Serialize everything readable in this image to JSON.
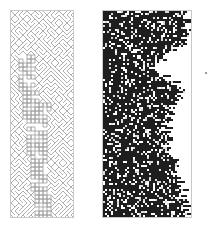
{
  "figure": {
    "panels": [
      {
        "id": "left",
        "description": "light gray lattice of interacting diagonal lines (automaton with particle interactions)",
        "line_color": "#9c9c9c",
        "background": "#ffffff",
        "cell": 4,
        "cols": 16,
        "rows": 52
      },
      {
        "id": "right",
        "description": "dense dark random pattern with jagged right growth front",
        "fill_color": "#1e1e1e",
        "speck_color": "#d8d8d8",
        "background": "#ffffff",
        "cell": 2,
        "cols": 45,
        "rows": 104,
        "edge_profile": [
          [
            0,
            86
          ],
          [
            10,
            85
          ],
          [
            20,
            84
          ],
          [
            30,
            83
          ],
          [
            40,
            66
          ],
          [
            50,
            56
          ],
          [
            55,
            48
          ],
          [
            62,
            58
          ],
          [
            70,
            70
          ],
          [
            80,
            76
          ],
          [
            88,
            78
          ],
          [
            95,
            70
          ],
          [
            105,
            64
          ],
          [
            115,
            62
          ],
          [
            125,
            63
          ],
          [
            135,
            64
          ],
          [
            145,
            72
          ],
          [
            155,
            76
          ],
          [
            165,
            74
          ],
          [
            175,
            77
          ],
          [
            185,
            80
          ],
          [
            195,
            84
          ],
          [
            207,
            88
          ]
        ]
      }
    ],
    "stray_mark_color": "#9a9a9a"
  }
}
